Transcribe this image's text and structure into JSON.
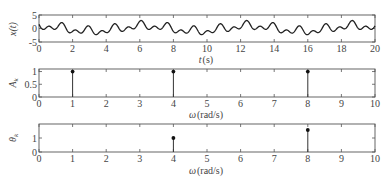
{
  "chart_data": [
    {
      "type": "line",
      "name": "time-signal",
      "title": "",
      "xlabel": "t (s)",
      "ylabel": "x(t)",
      "xlim": [
        0,
        20
      ],
      "ylim": [
        -5,
        5
      ],
      "xticks": [
        0,
        2,
        4,
        6,
        8,
        10,
        12,
        14,
        16,
        18,
        20
      ],
      "yticks": [
        -5,
        0,
        5
      ],
      "grid": false,
      "components": [
        {
          "omega": 1,
          "amplitude": 1,
          "phase": 0
        },
        {
          "omega": 4,
          "amplitude": 1,
          "phase": 1
        },
        {
          "omega": 8,
          "amplitude": 1,
          "phase": 1.5708
        }
      ],
      "description": "x(t) = sum A_k cos(omega_k t + theta_k), oscillating roughly between -3 and 3"
    },
    {
      "type": "stem",
      "name": "amplitude-spectrum",
      "xlabel": "ω (rad/s)",
      "ylabel": "A_k",
      "xlim": [
        0,
        10
      ],
      "ylim": [
        0,
        1.1
      ],
      "xticks": [
        0,
        1,
        2,
        3,
        4,
        5,
        6,
        7,
        8,
        9,
        10
      ],
      "yticks": [
        0,
        0.5,
        1
      ],
      "x": [
        1,
        4,
        8
      ],
      "values": [
        1,
        1,
        1
      ]
    },
    {
      "type": "stem",
      "name": "phase-spectrum",
      "xlabel": "ω (rad/s)",
      "ylabel": "θ_k",
      "xlim": [
        0,
        10
      ],
      "ylim": [
        0,
        2
      ],
      "xticks": [
        0,
        1,
        2,
        3,
        4,
        5,
        6,
        7,
        8,
        9,
        10
      ],
      "yticks": [
        0,
        1
      ],
      "x": [
        1,
        4,
        8
      ],
      "values": [
        0,
        1,
        1.57
      ]
    }
  ],
  "labels": {
    "top_ylabel": "x(t)",
    "top_xlabel_var": "t",
    "top_xlabel_unit": "(s)",
    "mid_ylabel": "A",
    "mid_ylabel_sub": "k",
    "bot_ylabel": "θ",
    "bot_ylabel_sub": "k",
    "omega_var": "ω",
    "omega_unit": "(rad/s)"
  }
}
